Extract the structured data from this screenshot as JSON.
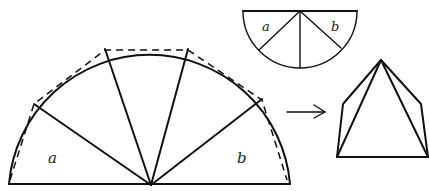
{
  "diagram": {
    "large_semicircle": {
      "labels": {
        "left_sector": "a",
        "right_sector": "b"
      },
      "sector_count": 5,
      "chords_style": "dashed"
    },
    "small_semicircle": {
      "labels": {
        "left_sector": "a",
        "right_sector": "b"
      },
      "sector_count": 4
    },
    "arrow": {
      "direction": "right"
    },
    "result_shape": "pyramid",
    "colors": {
      "ink": "#111111",
      "background": "#ffffff"
    }
  }
}
